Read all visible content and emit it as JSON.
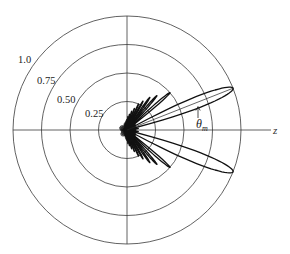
{
  "chart_data": {
    "type": "polar",
    "title": "",
    "radial_axis": {
      "range": [
        0,
        1.0
      ],
      "ticks": [
        0.25,
        0.5,
        0.75,
        1.0
      ],
      "tick_labels": [
        "0.25",
        "0.50",
        "0.75",
        "1.0"
      ],
      "grid": true
    },
    "angular_axis": {
      "reference_axis_label": "z",
      "zero_direction": "right"
    },
    "annotation": {
      "label": "θ",
      "subscript": "m",
      "meaning": "main-lobe angle from z-axis"
    },
    "series": [
      {
        "name": "pattern",
        "symmetric_about_z": true,
        "lobes": [
          {
            "angle_deg": 21.5,
            "magnitude": 1.0,
            "half_width_deg": 6.5
          },
          {
            "angle_deg": 41,
            "magnitude": 0.5,
            "half_width_deg": 2.6
          },
          {
            "angle_deg": 49,
            "magnitude": 0.4,
            "half_width_deg": 2.3
          },
          {
            "angle_deg": 55,
            "magnitude": 0.35,
            "half_width_deg": 2.2
          },
          {
            "angle_deg": 61,
            "magnitude": 0.29,
            "half_width_deg": 2.1
          },
          {
            "angle_deg": 66,
            "magnitude": 0.25,
            "half_width_deg": 2.0
          },
          {
            "angle_deg": 71,
            "magnitude": 0.2,
            "half_width_deg": 2.0
          },
          {
            "angle_deg": 76,
            "magnitude": 0.17,
            "half_width_deg": 2.0
          },
          {
            "angle_deg": 81,
            "magnitude": 0.14,
            "half_width_deg": 2.0
          },
          {
            "angle_deg": 86,
            "magnitude": 0.12,
            "half_width_deg": 2.0
          },
          {
            "angle_deg": 33,
            "magnitude": 0.08,
            "half_width_deg": 2.0
          },
          {
            "angle_deg": 8,
            "magnitude": 0.1,
            "half_width_deg": 2.5
          }
        ],
        "core_blob_radius": 0.07
      }
    ]
  },
  "labels": {
    "z_axis": "z",
    "theta": "θ",
    "theta_sub": "m",
    "ring_1": "1.0",
    "ring_075": "0.75",
    "ring_050": "0.50",
    "ring_025": "0.25"
  },
  "geometry": {
    "center": [
      127,
      130
    ],
    "outer_radius_px": 114
  }
}
